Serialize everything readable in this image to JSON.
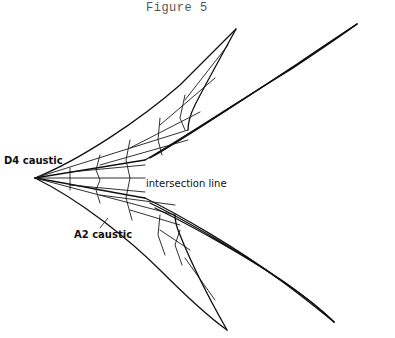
{
  "figure": {
    "title": "Figure 5",
    "labels": {
      "d4": "D4 caustic",
      "intersection": "intersection line",
      "a2": "A2 caustic"
    },
    "colors": {
      "ink": "#111111",
      "title": "#555555",
      "background": "#ffffff"
    },
    "geometry": {
      "cusp": [
        35,
        178
      ],
      "tips": {
        "upper_inner": [
          236,
          29
        ],
        "upper_outer": [
          357,
          24
        ],
        "lower_inner": [
          227,
          330
        ],
        "lower_outer": [
          334,
          322
        ]
      },
      "outer_edges": [
        "M35,178 C80,160 140,120 180,85 C200,65 220,45 236,29",
        "M35,178 C70,172 110,166 145,160",
        "M236,29 C222,55 205,85 195,105 C190,115 188,125 188,130",
        "M145,160 C180,140 240,100 290,70 C320,50 345,33 357,24",
        "M150,158 C185,138 245,98 295,66 C325,46 345,32 357,24",
        "M155,155 C190,135 250,95 300,62 C328,43 348,30 357,24",
        "M35,178 C80,200 130,240 160,270 C185,295 210,318 227,330",
        "M35,178 C70,184 110,192 145,198",
        "M227,330 C210,300 190,260 180,235 C176,226 175,220 175,215",
        "M145,198 C180,215 240,250 280,280 C305,298 325,315 334,322",
        "M150,203 C185,220 245,255 285,283 C310,300 327,315 334,322",
        "M155,208 C190,225 250,258 290,286 C312,302 328,316 334,322"
      ],
      "web_lines": [
        "M70,168 L70,190",
        "M100,155 L96,170 L100,180 L96,190 L100,203",
        "M130,140 L126,160 L130,178 L126,198 L132,220",
        "M160,118 L158,140 L162,155",
        "M185,95 L180,118 L185,130",
        "M160,215 L158,235 L165,255",
        "M180,230 L175,245 L182,265",
        "M35,178 L188,130",
        "M35,178 L175,215",
        "M35,178 L145,178",
        "M70,172 L145,165",
        "M70,185 L145,192",
        "M100,165 L188,140",
        "M100,195 L175,205",
        "M130,148 L200,112",
        "M130,210 L180,225",
        "M160,125 L215,78",
        "M160,230 L190,250",
        "M185,100 L228,45",
        "M185,258 L215,300"
      ]
    }
  }
}
